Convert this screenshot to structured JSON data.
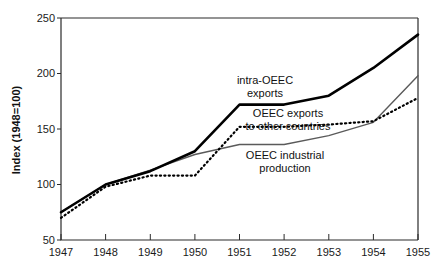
{
  "chart_data": {
    "type": "line",
    "title": "",
    "xlabel": "",
    "ylabel": "Index  (1948=100)",
    "x": [
      1947,
      1948,
      1949,
      1950,
      1951,
      1952,
      1953,
      1954,
      1955
    ],
    "xtick_labels": [
      "1947",
      "1948",
      "1949",
      "1950",
      "1951",
      "1952",
      "1953",
      "1954",
      "1955"
    ],
    "ytick_labels": [
      "50",
      "100",
      "150",
      "200",
      "250"
    ],
    "yticks": [
      50,
      100,
      150,
      200,
      250
    ],
    "ylim": [
      50,
      250
    ],
    "xlim": [
      1947,
      1955
    ],
    "grid": false,
    "legend_position": "inline-annotations",
    "series": [
      {
        "name": "intra-OEEC exports",
        "style": "solid-thick-black",
        "color": "#000000",
        "values": [
          75,
          100,
          112,
          130,
          172,
          172,
          180,
          205,
          235
        ]
      },
      {
        "name": "OEEC exports to other countries",
        "style": "dotted-black",
        "color": "#000000",
        "values": [
          70,
          98,
          108,
          108,
          152,
          152,
          154,
          157,
          178
        ]
      },
      {
        "name": "OEEC industrial production",
        "style": "solid-thin-gray",
        "color": "#5a5a5a",
        "values": [
          75,
          100,
          113,
          127,
          136,
          136,
          144,
          156,
          198
        ]
      }
    ],
    "annotations": [
      {
        "id": "anno-intra-oeec-exports",
        "lines": [
          "intra-OEEC",
          "exports"
        ],
        "x": 265,
        "y": 84
      },
      {
        "id": "anno-oeec-exports-other",
        "lines": [
          "OEEC exports",
          "to other countries"
        ],
        "x": 288,
        "y": 117
      },
      {
        "id": "anno-oeec-industrial",
        "lines": [
          "OEEC industrial",
          "production"
        ],
        "x": 285,
        "y": 159
      }
    ]
  },
  "axes": {
    "y_axis_title": "Index  (1948=100)",
    "y_ticks": [
      {
        "label": "250",
        "value": 250
      },
      {
        "label": "200",
        "value": 200
      },
      {
        "label": "150",
        "value": 150
      },
      {
        "label": "100",
        "value": 100
      },
      {
        "label": "50",
        "value": 50
      }
    ],
    "x_ticks": [
      {
        "label": "1947",
        "value": 1947
      },
      {
        "label": "1948",
        "value": 1948
      },
      {
        "label": "1949",
        "value": 1949
      },
      {
        "label": "1950",
        "value": 1950
      },
      {
        "label": "1951",
        "value": 1951
      },
      {
        "label": "1952",
        "value": 1952
      },
      {
        "label": "1953",
        "value": 1953
      },
      {
        "label": "1954",
        "value": 1954
      },
      {
        "label": "1955",
        "value": 1955
      }
    ]
  },
  "colors": {
    "background": "#ffffff",
    "axis": "#2b2b2b",
    "series_primary": "#000000",
    "series_secondary": "#5a5a5a",
    "text": "#111111"
  }
}
